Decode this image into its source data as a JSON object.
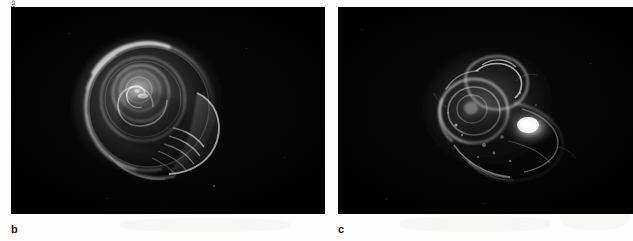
{
  "figure": {
    "background_color": "#fdfdfd",
    "photo_credit": "DAVID LITTSCHWAGER/National Geographic Stock",
    "panels": [
      {
        "id": "b",
        "label": "b",
        "background_color": "#050505",
        "subject": "pteropod-shell-intact",
        "description": "Intact translucent coiled pteropod shell photographed against a black background"
      },
      {
        "id": "c",
        "label": "c",
        "background_color": "#050505",
        "subject": "pteropod-shell-dissolved",
        "description": "Eroded and partially dissolved pteropod shell photographed against a black background"
      }
    ]
  }
}
